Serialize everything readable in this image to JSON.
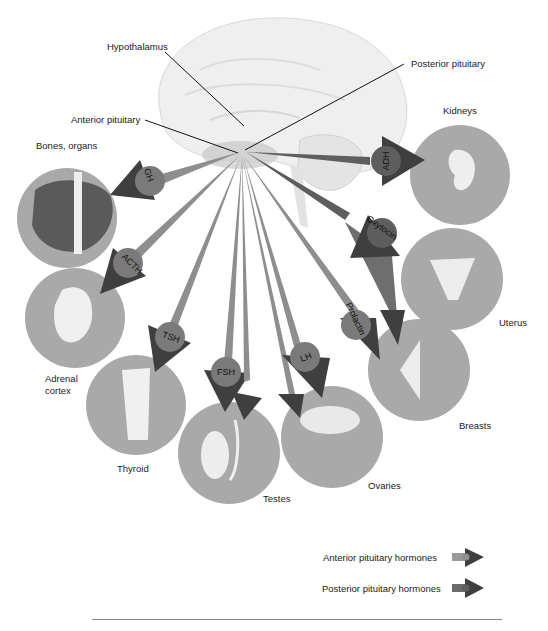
{
  "labels": {
    "hypothalamus": "Hypothalamus",
    "posterior_pituitary": "Posterior pituitary",
    "anterior_pituitary": "Anterior pituitary"
  },
  "targets": [
    {
      "id": "bones",
      "label": "Bones, organs",
      "hormone": "GH",
      "lobe": "anterior"
    },
    {
      "id": "adrenal",
      "label": "Adrenal",
      "label2": "cortex",
      "hormone": "ACTH",
      "lobe": "anterior"
    },
    {
      "id": "thyroid",
      "label": "Thyroid",
      "hormone": "TSH",
      "lobe": "anterior"
    },
    {
      "id": "testes",
      "label": "Testes",
      "hormone": "FSH",
      "lobe": "anterior"
    },
    {
      "id": "ovaries",
      "label": "Ovaries",
      "hormone": "LH",
      "lobe": "anterior"
    },
    {
      "id": "breasts",
      "label": "Breasts",
      "hormone": "Prolactin",
      "lobe": "anterior"
    },
    {
      "id": "uterus",
      "label": "Uterus",
      "hormone": "Oxytocin",
      "lobe": "posterior"
    },
    {
      "id": "kidneys",
      "label": "Kidneys",
      "hormone": "ADH",
      "lobe": "posterior"
    }
  ],
  "legend": {
    "anterior": "Anterior pituitary hormones",
    "posterior": "Posterior pituitary hormones"
  },
  "colors": {
    "circle": "#a9a9a9",
    "anterior_arrow": "#8e8e8e",
    "posterior_arrow": "#5e5e5e",
    "arrow_head": "#3f3f3f",
    "hormone_disc": "#7a7a7a",
    "brain": "#ececec"
  }
}
